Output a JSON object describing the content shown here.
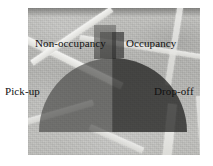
{
  "figure": {
    "kind": "annotated-photograph",
    "width": 213,
    "height": 166
  },
  "labels": {
    "top_left": "Non-occupancy",
    "top_right": "Occupancy",
    "bottom_left": "Pick-up",
    "bottom_right": "Drop-off"
  },
  "regions": [
    {
      "name": "non-occupancy-quadrant",
      "label": "Non-occupancy",
      "position": "upper-left",
      "fill": "#3f3f3d",
      "opacity": 0.62
    },
    {
      "name": "occupancy-quadrant",
      "label": "Occupancy",
      "position": "upper-right",
      "fill": "#1e1e1d",
      "opacity": 0.74
    },
    {
      "name": "pick-up-quadrant",
      "label": "Pick-up",
      "position": "lower-left",
      "fill": "#3f3f3d",
      "opacity": 0.62
    },
    {
      "name": "drop-off-quadrant",
      "label": "Drop-off",
      "position": "lower-right",
      "fill": "#1e1e1d",
      "opacity": 0.74
    }
  ],
  "colors": {
    "page_background": "#ffffff",
    "photo_background": "#bdbdba",
    "light_overlay": "#3f3f3d",
    "dark_overlay": "#1e1e1d",
    "lane_marking": "#f4f4f2",
    "label_text": "#111111"
  }
}
